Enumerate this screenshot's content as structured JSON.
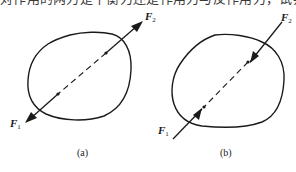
{
  "cropped_text_line": "对作用的两力是平衡力还是作用力与反作用力，试判断下图中哪些是平衡力作用于物体上，哪些是作用于两个物体上。",
  "figures": [
    {
      "id": "a",
      "caption": "(a)",
      "force_top": {
        "symbol": "F",
        "subscript": "2",
        "direction": "outward (pulling away from body)"
      },
      "force_bottom": {
        "symbol": "F",
        "subscript": "1",
        "direction": "outward (pulling away from body)"
      }
    },
    {
      "id": "b",
      "caption": "(b)",
      "force_top": {
        "symbol": "F",
        "subscript": "2",
        "direction": "inward (pushing toward body)"
      },
      "force_bottom": {
        "symbol": "F",
        "subscript": "1",
        "direction": "inward (pushing toward body)"
      }
    }
  ],
  "colors": {
    "line": "#1a1a1a",
    "background": "#ffffff"
  }
}
